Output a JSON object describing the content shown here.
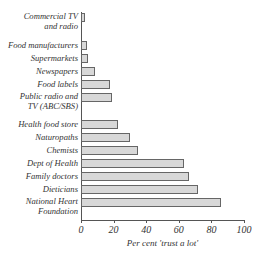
{
  "chart_data": {
    "type": "bar",
    "orientation": "horizontal",
    "title": "",
    "xlabel": "Per cent 'trust a lot'",
    "ylabel": "",
    "xlim": [
      0,
      100
    ],
    "xticks": [
      "0",
      "20",
      "40",
      "60",
      "80",
      "100"
    ],
    "grid": false,
    "legend": null,
    "categories": [
      "Commercial TV and radio",
      "Food manufacturers",
      "Supermarkets",
      "Newspapers",
      "Food labels",
      "Public radio and TV (ABC/SBS)",
      "Health food store",
      "Naturopaths",
      "Chemists",
      "Dept of Health",
      "Family doctors",
      "Dieticians",
      "National Heart Foundation"
    ],
    "values": [
      2.5,
      3.5,
      4,
      8.5,
      18,
      19,
      23,
      30,
      35,
      63,
      66,
      72,
      86
    ]
  },
  "labels": [
    {
      "line1": "Commercial TV",
      "line2": "and radio"
    },
    {
      "line1": "Food manufacturers",
      "line2": ""
    },
    {
      "line1": "Supermarkets",
      "line2": ""
    },
    {
      "line1": "Newspapers",
      "line2": ""
    },
    {
      "line1": "Food labels",
      "line2": ""
    },
    {
      "line1": "Public radio and",
      "line2": "TV (ABC/SBS)"
    },
    {
      "line1": "Health food store",
      "line2": ""
    },
    {
      "line1": "Naturopaths",
      "line2": ""
    },
    {
      "line1": "Chemists",
      "line2": ""
    },
    {
      "line1": "Dept of Health",
      "line2": ""
    },
    {
      "line1": "Family doctors",
      "line2": ""
    },
    {
      "line1": "Dieticians",
      "line2": ""
    },
    {
      "line1": "National Heart",
      "line2": "Foundation"
    }
  ],
  "colors": {
    "bar_fill": "#d8d8d8",
    "bar_border": "#666666",
    "axis": "#555555"
  }
}
